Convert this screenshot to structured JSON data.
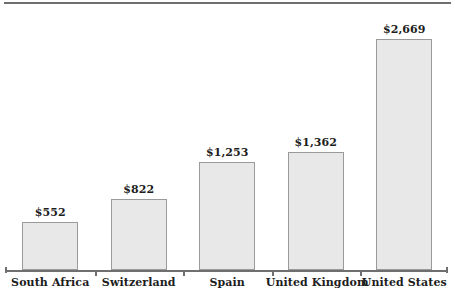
{
  "chart_data": {
    "type": "bar",
    "title": "",
    "subtitle": "",
    "xlabel": "",
    "ylabel": "",
    "categories": [
      "South Africa",
      "Switzerland",
      "Spain",
      "United Kingdom",
      "United States"
    ],
    "values": [
      552,
      822,
      1253,
      1362,
      2669
    ],
    "value_labels": [
      "$552",
      "$822",
      "$1,253",
      "$1,362",
      "$2,669"
    ],
    "ylim": [
      0,
      2669
    ],
    "grid": false,
    "legend": false,
    "axis": {
      "y_axis_visible": false,
      "x_axis_visible": true,
      "y_tick_labels": []
    },
    "style": {
      "bar_fill": "#e8e8e8",
      "bar_border": "#9a9a9a",
      "axis_color": "#6f6f6f",
      "text_color": "#1d1d1d",
      "background": "#ffffff"
    }
  }
}
